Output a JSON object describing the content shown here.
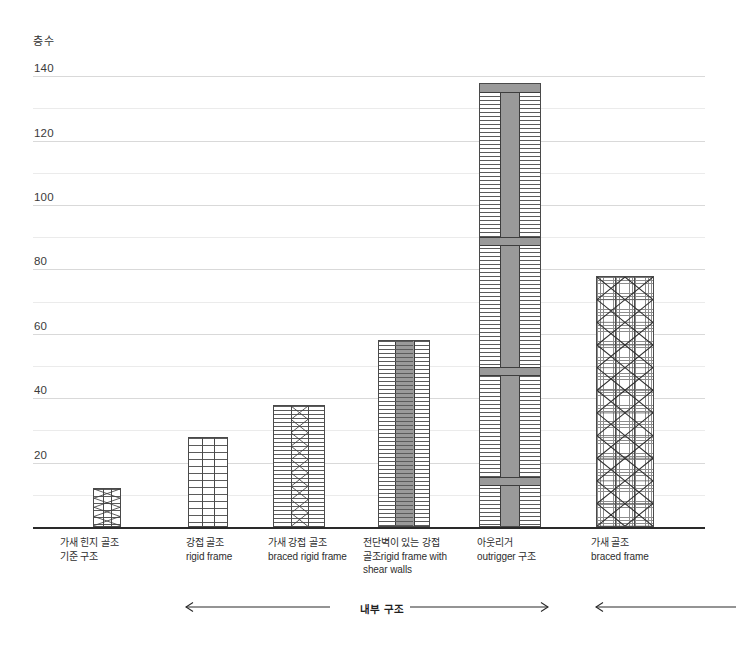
{
  "chart_data": {
    "type": "bar",
    "title": "",
    "ylabel": "층수",
    "xlabel": "",
    "ylim": [
      0,
      145
    ],
    "ytick_step": 20,
    "gridline_step": 10,
    "grid": true,
    "legend": "none",
    "ytick_labels": [
      "140",
      "120",
      "100",
      "80",
      "60",
      "40",
      "20"
    ],
    "ytick_values": [
      140,
      120,
      100,
      80,
      60,
      40,
      20
    ],
    "categories": [
      "가새 힌지 골조\n기준 구조",
      "강접 골조\nrigid frame",
      "가새 강접 골조\nbraced rigid frame",
      "전단벽이 있는 강접\n골조rigid frame with\nshear walls",
      "아웃리거\noutrigger 구조",
      "가새 골조\nbraced frame"
    ],
    "categories_ko": [
      "가새 힌지 골조 기준 구조",
      "강접 골조",
      "가새 강접 골조",
      "전단벽이 있는 강접 골조",
      "아웃리거 구조",
      "가새 골조"
    ],
    "categories_en": [
      "",
      "rigid frame",
      "braced rigid frame",
      "rigid frame with shear walls",
      "outrigger",
      "braced frame"
    ],
    "values": [
      12,
      28,
      38,
      58,
      138,
      78
    ],
    "bar_styles": [
      "braced-hinged-frame",
      "rigid-frame-grid",
      "braced-rigid-frame-core",
      "shear-wall-core",
      "outrigger-core-belts",
      "braced-frame-diagonals"
    ]
  },
  "annotation": {
    "inner_structure_label": "내부 구조",
    "left_arrow": "←",
    "right_arrow": "→",
    "outer_arrow": "←"
  },
  "colors": {
    "axis": "#2a2a2a",
    "gridline_major": "#d9d9d9",
    "gridline_minor": "#ebebeb",
    "bar_outline": "#4a4a4a",
    "core_fill": "#9a9a9a",
    "text": "#2e2e2e",
    "background": "#ffffff"
  }
}
